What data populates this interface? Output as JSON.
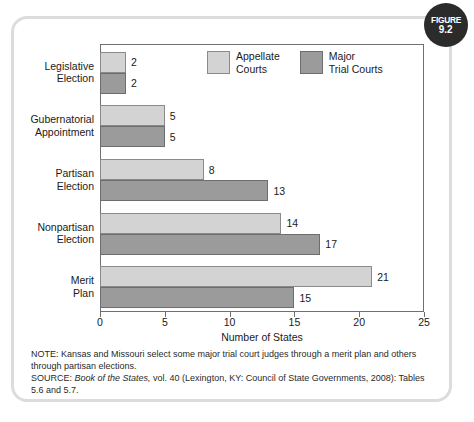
{
  "figure": {
    "badge_word": "FIGURE",
    "badge_number": "9.2"
  },
  "chart_data": {
    "type": "bar",
    "orientation": "horizontal",
    "title": "",
    "xlabel": "Number of States",
    "ylabel": "",
    "xlim": [
      0,
      25
    ],
    "xticks": [
      0,
      5,
      10,
      15,
      20,
      25
    ],
    "xtick_labels": [
      "0",
      "5",
      "10",
      "15",
      "20",
      "25"
    ],
    "grid": false,
    "legend_position": "top-center",
    "categories": [
      "Legislative\nElection",
      "Gubernatorial\nAppointment",
      "Partisan\nElection",
      "Nonpartisan\nElection",
      "Merit\nPlan"
    ],
    "series": [
      {
        "name": "Appellate\nCourts",
        "legend_label": "Appellate\nCourts",
        "color": "#d3d3d3",
        "values": [
          2,
          5,
          8,
          14,
          21
        ],
        "value_labels": [
          "2",
          "5",
          "8",
          "14",
          "21"
        ]
      },
      {
        "name": "Major\nTrial Courts",
        "legend_label": "Major\nTrial Courts",
        "color": "#9b9b9b",
        "values": [
          2,
          5,
          13,
          17,
          15
        ],
        "value_labels": [
          "2",
          "5",
          "13",
          "17",
          "15"
        ]
      }
    ]
  },
  "footnotes": {
    "note_prefix": "NOTE:",
    "note_text": " Kansas and Missouri select some major trial court judges through a merit plan and others through partisan elections.",
    "source_prefix": "SOURCE:",
    "source_title": "Book of the States,",
    "source_rest": " vol. 40 (Lexington, KY: Council of State Governments, 2008): Tables 5.6 and 5.7."
  }
}
